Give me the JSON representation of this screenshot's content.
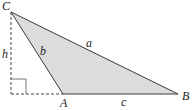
{
  "diagram": {
    "type": "triangle-with-altitude",
    "vertices": {
      "C": {
        "label": "C",
        "x": 11,
        "y": 12
      },
      "A": {
        "label": "A",
        "x": 63,
        "y": 94
      },
      "B": {
        "label": "B",
        "x": 178,
        "y": 94
      }
    },
    "sides": {
      "a": {
        "label": "a",
        "from": "C",
        "to": "B"
      },
      "b": {
        "label": "b",
        "from": "C",
        "to": "A"
      },
      "c": {
        "label": "c",
        "from": "A",
        "to": "B"
      }
    },
    "altitude": {
      "label": "h",
      "style": "dashed"
    },
    "colors": {
      "fill": "#dcdcdc",
      "stroke": "#3a3a3a",
      "dashed": "#444444"
    }
  }
}
